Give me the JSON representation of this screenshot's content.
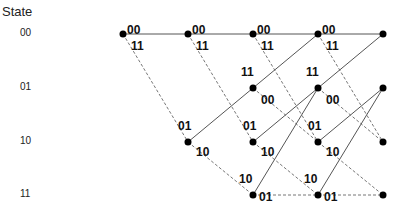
{
  "title": "State",
  "states": [
    "00",
    "01",
    "10",
    "11"
  ],
  "columns": 5,
  "edges_solid_color": "#555555",
  "edges_dashed_color": "#777777",
  "transitions": [
    {
      "from": "00",
      "to": "00",
      "output": "00",
      "style": "solid"
    },
    {
      "from": "00",
      "to": "10",
      "output": "11",
      "style": "dashed"
    },
    {
      "from": "01",
      "to": "00",
      "output": "11",
      "style": "solid"
    },
    {
      "from": "01",
      "to": "10",
      "output": "00",
      "style": "dashed"
    },
    {
      "from": "10",
      "to": "01",
      "output": "01",
      "style": "solid"
    },
    {
      "from": "10",
      "to": "11",
      "output": "10",
      "style": "dashed"
    },
    {
      "from": "11",
      "to": "01",
      "output": "10",
      "style": "solid"
    },
    {
      "from": "11",
      "to": "11",
      "output": "01",
      "style": "dashed"
    }
  ]
}
